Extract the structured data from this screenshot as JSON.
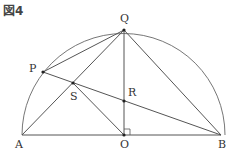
{
  "figure": {
    "title": "図4",
    "points": {
      "A": {
        "label": "A",
        "x": 22,
        "y": 135
      },
      "O": {
        "label": "O",
        "x": 124,
        "y": 135
      },
      "B": {
        "label": "B",
        "x": 221,
        "y": 135
      },
      "Q": {
        "label": "Q",
        "x": 124,
        "y": 30
      },
      "P": {
        "label": "P",
        "x": 43,
        "y": 72
      },
      "S": {
        "label": "S",
        "x": 73,
        "y": 83
      },
      "R": {
        "label": "R",
        "x": 124,
        "y": 101
      }
    },
    "semicircle": {
      "center": "O",
      "radius": 100
    },
    "segments": [
      "AB",
      "OQ",
      "AQ",
      "BQ",
      "PQ",
      "PB",
      "OS"
    ],
    "right_angle_at": "O",
    "line_color": "#555555"
  }
}
